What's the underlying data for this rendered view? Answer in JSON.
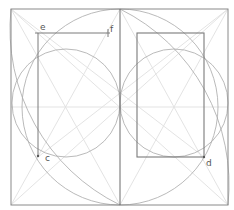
{
  "diagram": {
    "labels": {
      "e": "e",
      "f": "f",
      "c": "c",
      "d": "d"
    },
    "colors": {
      "frame": "#8a8a8a",
      "rectangle": "#7a7a7a",
      "circle": "#a8a8a8",
      "guide": "#e0e0e0",
      "label": "#555555"
    },
    "elements": [
      "outer square frame",
      "vertical center line",
      "horizontal mid line",
      "large circle inscribed in square",
      "left half circle",
      "right half circle",
      "left quarter arcs from corners",
      "right quarter arcs from corners",
      "diagonal guide lines",
      "left rectangle with segment e-f",
      "right rectangle ending at d"
    ]
  }
}
